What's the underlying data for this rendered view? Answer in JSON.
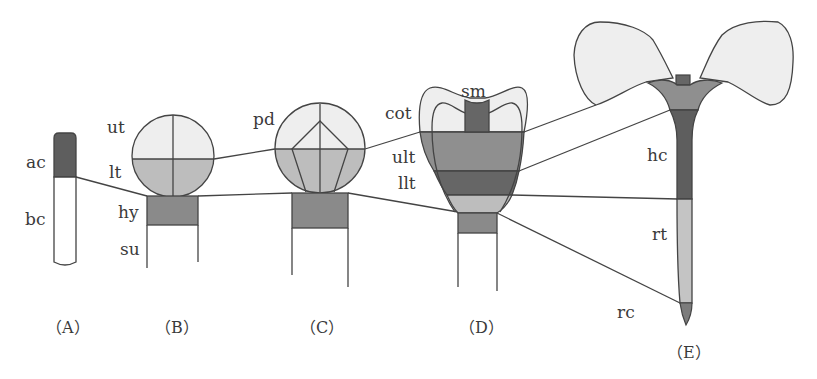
{
  "colors": {
    "upper_tier": "#eeeeee",
    "lower_tier": "#bdbdbd",
    "hypophysis": "#8a8a8a",
    "apical_cell": "#5e5e5e",
    "dark": "#666666",
    "root_tip": "#c4c4c4",
    "root_cap": "#7c7c7c",
    "outline": "#444444"
  },
  "stages": {
    "A": {
      "caption": "（A）",
      "labels": {
        "ac": "ac",
        "bc": "bc"
      }
    },
    "B": {
      "caption": "（B）",
      "labels": {
        "ut": "ut",
        "lt": "lt",
        "hy": "hy",
        "su": "su"
      }
    },
    "C": {
      "caption": "（C）",
      "labels": {
        "pd": "pd"
      }
    },
    "D": {
      "caption": "（D）",
      "labels": {
        "cot": "cot",
        "sm": "sm",
        "ult": "ult",
        "llt": "llt"
      }
    },
    "E": {
      "caption": "（E）",
      "labels": {
        "hc": "hc",
        "rt": "rt",
        "rc": "rc"
      }
    }
  }
}
